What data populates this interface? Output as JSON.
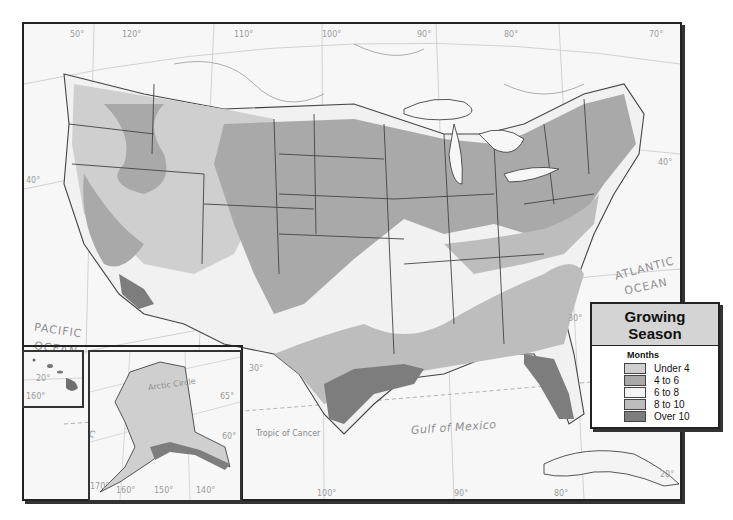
{
  "map": {
    "title": "Growing Season",
    "legend": {
      "title_line1": "Growing",
      "title_line2": "Season",
      "subtitle": "Months",
      "items": [
        {
          "label": "Under 4",
          "color": "#cfcfcf"
        },
        {
          "label": "4 to 6",
          "color": "#a9a9a9"
        },
        {
          "label": "6 to 8",
          "color": "#f3f3f3"
        },
        {
          "label": "8 to 10",
          "color": "#bdbdbd"
        },
        {
          "label": "Over 10",
          "color": "#7d7d7d"
        }
      ]
    },
    "labels": {
      "pacific_ocean_1": "PACIFIC",
      "pacific_ocean_2": "OCEAN",
      "atlantic_ocean_1": "ATLANTIC",
      "atlantic_ocean_2": "OCEAN",
      "gulf": "Gulf of Mexico",
      "tropic": "Tropic of Cancer",
      "arctic": "Arctic Circle",
      "inset_pacific_1": "PACIFIC",
      "inset_pacific_2": "OCEAN"
    },
    "graticule": {
      "lon_top": [
        "120°",
        "110°",
        "100°",
        "90°",
        "80°",
        "70°"
      ],
      "lon_bottom": [
        "120°",
        "110°",
        "100°",
        "90°",
        "80°"
      ],
      "lat_left": [
        "50°",
        "40°",
        "30°"
      ],
      "lat_right": [
        "40°",
        "30°",
        "20°"
      ],
      "hawaii": [
        "20°",
        "160°"
      ],
      "alaska": [
        "170°",
        "160°",
        "150°",
        "140°",
        "65°",
        "60°",
        "180°"
      ]
    }
  }
}
